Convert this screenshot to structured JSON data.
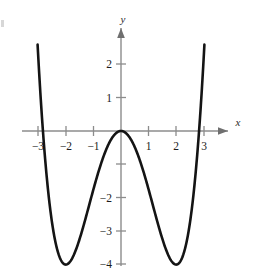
{
  "figure": {
    "background_color": "#ffffff",
    "curve_color": "#141414",
    "axis_color": "#8c8c8c",
    "text_color": "#1c1c1c"
  },
  "axes": {
    "x_axis_label": "x",
    "y_axis_label": "y",
    "x_ticks": [
      {
        "value": -3,
        "label": "−3"
      },
      {
        "value": -2,
        "label": "−2"
      },
      {
        "value": -1,
        "label": "−1"
      },
      {
        "value": 1,
        "label": "1"
      },
      {
        "value": 2,
        "label": "2"
      },
      {
        "value": 3,
        "label": "3"
      }
    ],
    "y_ticks": [
      {
        "value": 2,
        "label": "2"
      },
      {
        "value": 1,
        "label": "1"
      },
      {
        "value": -1,
        "label": ""
      },
      {
        "value": -2,
        "label": "−2"
      },
      {
        "value": -3,
        "label": "−3"
      },
      {
        "value": -4,
        "label": "−4"
      }
    ]
  },
  "chart_data": {
    "type": "line",
    "title": "",
    "xlabel": "x",
    "ylabel": "y",
    "xlim": [
      -3.35,
      3.35
    ],
    "ylim": [
      -4.55,
      2.7
    ],
    "grid": false,
    "legend": "none",
    "series": [
      {
        "name": "quartic",
        "equation": "y = 0.25*x^4 - 2*x^2",
        "x": [
          -3.0,
          -2.9,
          -2.8,
          -2.7,
          -2.6,
          -2.5,
          -2.4,
          -2.3,
          -2.2,
          -2.1,
          -2.0,
          -1.9,
          -1.8,
          -1.7,
          -1.6,
          -1.5,
          -1.4,
          -1.3,
          -1.2,
          -1.1,
          -1.0,
          -0.9,
          -0.8,
          -0.7,
          -0.6,
          -0.5,
          -0.4,
          -0.3,
          -0.2,
          -0.1,
          0.0,
          0.1,
          0.2,
          0.3,
          0.4,
          0.5,
          0.6,
          0.7,
          0.8,
          0.9,
          1.0,
          1.1,
          1.2,
          1.3,
          1.4,
          1.5,
          1.6,
          1.7,
          1.8,
          1.9,
          2.0,
          2.1,
          2.2,
          2.3,
          2.4,
          2.5,
          2.6,
          2.7,
          2.8,
          2.9,
          3.0
        ],
        "y": [
          2.25,
          1.43,
          0.72,
          0.11,
          -0.4,
          -0.84,
          -1.2,
          -1.5,
          -1.73,
          -1.9,
          -2.0,
          -2.04,
          -2.02,
          -1.93,
          -1.76,
          -1.48,
          -1.12,
          -0.66,
          -0.1,
          0.54,
          1.25,
          2.03,
          2.85,
          3.71,
          4.6,
          5.5,
          6.4,
          7.29,
          8.15,
          8.98,
          9.77,
          10.5,
          11.17,
          11.77,
          12.3,
          12.74,
          13.09,
          13.35,
          13.51,
          13.57,
          13.53,
          13.38,
          13.12,
          12.76,
          12.29,
          11.72,
          11.05,
          10.27,
          9.4,
          8.43,
          7.37,
          6.23,
          5.0,
          3.69,
          2.32,
          0.88,
          -0.61,
          -2.16,
          -3.75,
          -5.38,
          -7.05
        ]
      }
    ],
    "key_points": {
      "local_maximum": {
        "x": 0,
        "y": 0
      },
      "local_minima": [
        {
          "x": -2,
          "y": -4
        },
        {
          "x": 2,
          "y": -4
        }
      ],
      "x_intercepts": [
        -2.83,
        0,
        2.83
      ]
    }
  }
}
